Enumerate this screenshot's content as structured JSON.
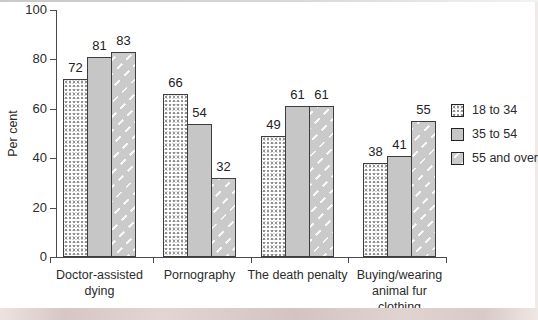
{
  "chart_data": {
    "type": "bar",
    "title": "",
    "xlabel": "",
    "ylabel": "Per cent",
    "ylim": [
      0,
      100
    ],
    "yticks": [
      0,
      20,
      40,
      60,
      80,
      100
    ],
    "grid": false,
    "data_labels": true,
    "legend_position": "right",
    "categories": [
      "Doctor-assisted dying",
      "Pornography",
      "The death penalty",
      "Buying/wearing animal fur clothing"
    ],
    "category_label_lines": [
      [
        "Doctor-assisted",
        "dying"
      ],
      [
        "Pornography"
      ],
      [
        "The death penalty"
      ],
      [
        "Buying/wearing",
        "animal fur",
        "clothing"
      ]
    ],
    "series": [
      {
        "name": "18 to 34",
        "pattern": "stipple",
        "values": [
          72,
          66,
          49,
          38
        ]
      },
      {
        "name": "35 to 54",
        "pattern": "solid",
        "values": [
          81,
          54,
          61,
          41
        ]
      },
      {
        "name": "55 and over",
        "pattern": "hatch",
        "values": [
          83,
          32,
          61,
          55
        ]
      }
    ],
    "colors": {
      "solid_bar": "#c6c6c6",
      "hatch_bar_base": "#cacaca",
      "stipple_dot": "#8f8f8f",
      "bar_border": "#3d3d3d",
      "axis": "#4a4a4a",
      "text": "#2b2b2b",
      "background": "#ffffff",
      "page_bottom_band": "#d6c7c4",
      "page_top_edge": "#c9c9c9"
    }
  }
}
